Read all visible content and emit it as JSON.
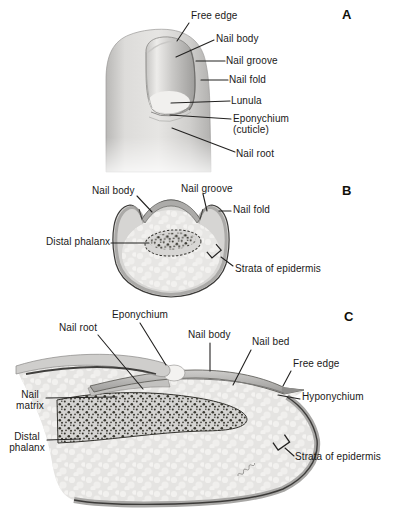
{
  "panelA": {
    "letter": "A",
    "labels": {
      "free_edge": "Free edge",
      "nail_body": "Nail body",
      "nail_groove": "Nail groove",
      "nail_fold": "Nail fold",
      "lunula": "Lunula",
      "eponychium": "Eponychium\n(cuticle)",
      "nail_root": "Nail root"
    }
  },
  "panelB": {
    "letter": "B",
    "labels": {
      "nail_body": "Nail body",
      "nail_groove": "Nail groove",
      "nail_fold": "Nail fold",
      "distal_phalanx": "Distal phalanx",
      "strata_of_epidermis": "Strata of epidermis"
    }
  },
  "panelC": {
    "letter": "C",
    "labels": {
      "eponychium": "Eponychium",
      "nail_root": "Nail root",
      "nail_body": "Nail body",
      "nail_bed": "Nail bed",
      "free_edge": "Free edge",
      "hyponychium": "Hyponychium",
      "nail_matrix": "Nail\nmatrix",
      "distal_phalanx": "Distal\nphalanx",
      "strata_of_epidermis": "Strata of epidermis"
    }
  },
  "colors": {
    "background": "#ffffff",
    "text": "#1a1918",
    "leader_line": "#232221",
    "skin_light": "#d8d7d5",
    "nail_plate": "#b0afad",
    "fat_tissue": "#e6e5e3",
    "bone": "#d5d4d2",
    "epidermis_band": "#a5a4a2"
  }
}
